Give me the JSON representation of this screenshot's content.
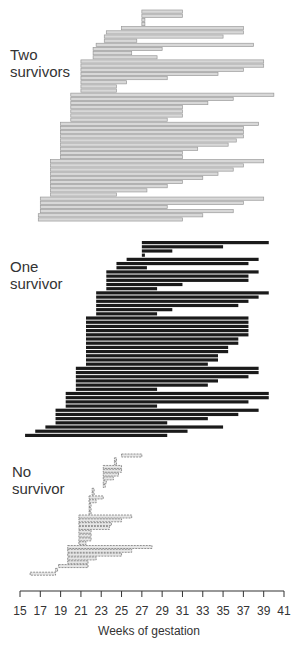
{
  "chart_data": {
    "type": "bar",
    "orientation": "horizontal-range",
    "title": "",
    "xlabel": "Weeks of gestation",
    "ylabel": "",
    "xlim": [
      15,
      41
    ],
    "x_ticks": [
      15,
      17,
      19,
      21,
      23,
      25,
      27,
      29,
      31,
      33,
      35,
      37,
      39,
      41
    ],
    "grid": false,
    "legend": null,
    "groups": [
      {
        "name": "Two survivors",
        "style": "outlined-grey",
        "color": "#9a9a9a",
        "bars": [
          [
            27,
            31
          ],
          [
            27,
            31
          ],
          [
            27,
            27.3
          ],
          [
            27,
            27.3
          ],
          [
            25,
            37
          ],
          [
            23.5,
            37
          ],
          [
            23.3,
            35
          ],
          [
            23.3,
            26.5
          ],
          [
            22.5,
            38
          ],
          [
            22.2,
            29
          ],
          [
            22.2,
            26
          ],
          [
            22.2,
            28.5
          ],
          [
            21,
            39
          ],
          [
            21,
            39
          ],
          [
            21,
            37
          ],
          [
            21,
            34.5
          ],
          [
            21,
            29.5
          ],
          [
            21,
            25.5
          ],
          [
            21,
            24.5
          ],
          [
            21,
            24.5
          ],
          [
            20,
            40
          ],
          [
            20,
            36
          ],
          [
            20,
            33.5
          ],
          [
            20,
            31
          ],
          [
            20,
            31
          ],
          [
            20,
            31
          ],
          [
            20,
            29.5
          ],
          [
            19,
            38.5
          ],
          [
            19,
            37
          ],
          [
            19,
            37
          ],
          [
            19,
            37
          ],
          [
            19,
            36.3
          ],
          [
            19,
            35.5
          ],
          [
            19,
            32.5
          ],
          [
            19,
            31
          ],
          [
            19,
            31
          ],
          [
            18,
            39
          ],
          [
            18,
            37
          ],
          [
            18,
            36
          ],
          [
            18,
            34.5
          ],
          [
            18,
            33
          ],
          [
            18,
            31
          ],
          [
            18,
            29.5
          ],
          [
            18,
            27.5
          ],
          [
            18,
            24.5
          ],
          [
            17,
            39
          ],
          [
            17,
            37
          ],
          [
            17,
            29.5
          ],
          [
            17,
            36
          ],
          [
            16.8,
            33
          ],
          [
            16.8,
            31
          ]
        ]
      },
      {
        "name": "One survivor",
        "style": "solid-black",
        "color": "#1a1a1a",
        "bars": [
          [
            27,
            39.5
          ],
          [
            27,
            35
          ],
          [
            27,
            30
          ],
          [
            27,
            27.3
          ],
          [
            25.5,
            38.5
          ],
          [
            24.5,
            37.5
          ],
          [
            24.5,
            27.5
          ],
          [
            23.5,
            38.5
          ],
          [
            23.5,
            37.5
          ],
          [
            23.5,
            37.5
          ],
          [
            23.5,
            31
          ],
          [
            23.5,
            28.5
          ],
          [
            22.5,
            39.5
          ],
          [
            22.5,
            38.5
          ],
          [
            22.5,
            37.5
          ],
          [
            22.5,
            36.5
          ],
          [
            22.5,
            30
          ],
          [
            22.5,
            28.5
          ],
          [
            21.5,
            37.5
          ],
          [
            21.5,
            37.5
          ],
          [
            21.5,
            37.5
          ],
          [
            21.5,
            37.5
          ],
          [
            21.5,
            37.5
          ],
          [
            21.5,
            36.5
          ],
          [
            21.5,
            36.5
          ],
          [
            21.5,
            35.5
          ],
          [
            21.5,
            35.5
          ],
          [
            21.5,
            34.5
          ],
          [
            21.5,
            34.5
          ],
          [
            21.5,
            33.5
          ],
          [
            20.5,
            38.5
          ],
          [
            20.5,
            38.5
          ],
          [
            20.5,
            37.5
          ],
          [
            20.5,
            34.5
          ],
          [
            20.5,
            33.5
          ],
          [
            20.5,
            28.5
          ],
          [
            19.5,
            39.5
          ],
          [
            19.5,
            39.5
          ],
          [
            19.5,
            37.5
          ],
          [
            19.5,
            28.5
          ],
          [
            18.5,
            38.5
          ],
          [
            18.5,
            36.5
          ],
          [
            18.5,
            33.5
          ],
          [
            18.5,
            29.5
          ],
          [
            17.5,
            35
          ],
          [
            16.5,
            31.5
          ],
          [
            15.5,
            29.5
          ]
        ]
      },
      {
        "name": "No survivor",
        "style": "dashed-outlined",
        "color": "#7a7a7a",
        "bars": [
          [
            25,
            27
          ],
          [
            24.3,
            24.5
          ],
          [
            24.3,
            24.5
          ],
          [
            23.2,
            25
          ],
          [
            23.2,
            25
          ],
          [
            23.2,
            24.7
          ],
          [
            23.2,
            24.2
          ],
          [
            23.2,
            23.5
          ],
          [
            23.2,
            23.3
          ],
          [
            22.1,
            22.3
          ],
          [
            22.1,
            22.3
          ],
          [
            21.8,
            23.2
          ],
          [
            21.8,
            22.5
          ],
          [
            21.8,
            22
          ],
          [
            21.8,
            22
          ],
          [
            21.8,
            22
          ],
          [
            20.8,
            26
          ],
          [
            20.8,
            25
          ],
          [
            20.8,
            24
          ],
          [
            20.8,
            23.8
          ],
          [
            20.8,
            22
          ],
          [
            20.8,
            22
          ],
          [
            20.8,
            22
          ],
          [
            20.8,
            21.5
          ],
          [
            19.7,
            28
          ],
          [
            19.7,
            26
          ],
          [
            19.7,
            25
          ],
          [
            19.7,
            22.5
          ],
          [
            19.7,
            21.7
          ],
          [
            18.8,
            21.7
          ],
          [
            18.5,
            18.7
          ],
          [
            16,
            18.5
          ]
        ]
      }
    ]
  },
  "labels": {
    "two": [
      "Two",
      "survivors"
    ],
    "one": [
      "One",
      "survivor"
    ],
    "none": [
      "No",
      "survivor"
    ]
  }
}
